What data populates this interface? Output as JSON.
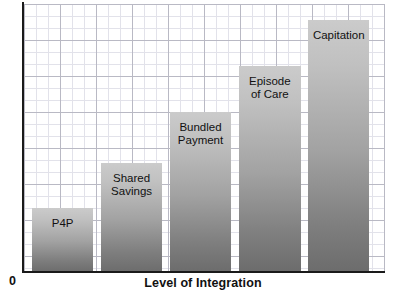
{
  "chart_data": {
    "type": "bar",
    "title": "",
    "subtitle": "",
    "xlabel": "Level of Integration",
    "ylabel": "Risk Tolerance",
    "origin_label": "0",
    "categories": [
      "P4P",
      "Shared Savings",
      "Bundled Payment",
      "Episode of Care",
      "Capitation"
    ],
    "values": [
      24,
      41,
      60,
      77,
      94
    ],
    "ylim": [
      0,
      100
    ],
    "xlim_note": "Level of Integration increases left to right (ordinal, unlabeled ticks)",
    "grid": true,
    "grid_minor": true,
    "legend": "none",
    "axis_tick_labels": [],
    "bars": [
      {
        "label": "P4P",
        "label_lines": [
          "P4P"
        ],
        "value": 24,
        "x_pct": 2.2,
        "width_pct": 17.0,
        "height_pct": 24.0
      },
      {
        "label": "Shared Savings",
        "label_lines": [
          "Shared",
          "Savings"
        ],
        "value": 41,
        "x_pct": 21.3,
        "width_pct": 17.0,
        "height_pct": 40.8
      },
      {
        "label": "Bundled Payment",
        "label_lines": [
          "Bundled",
          "Payment"
        ],
        "value": 60,
        "x_pct": 40.4,
        "width_pct": 17.0,
        "height_pct": 59.7
      },
      {
        "label": "Episode of Care",
        "label_lines": [
          "Episode",
          "of Care"
        ],
        "value": 77,
        "x_pct": 59.6,
        "width_pct": 17.0,
        "height_pct": 76.9
      },
      {
        "label": "Capitation",
        "label_lines": [
          "Capitation"
        ],
        "value": 94,
        "x_pct": 78.7,
        "width_pct": 17.0,
        "height_pct": 94.0
      }
    ],
    "colors": {
      "bar_top": "#cbcbcb",
      "bar_bottom": "#6c6c6c",
      "axis": "#1a1a1a",
      "grid_major": "#b9b9c4",
      "grid_minor": "#e2e2ea",
      "text": "#111111",
      "background": "#ffffff"
    }
  },
  "labels": {
    "bar_0": "P4P",
    "bar_1": "Shared\nSavings",
    "bar_2": "Bundled\nPayment",
    "bar_3": "Episode\nof Care",
    "bar_4": "Capitation"
  }
}
